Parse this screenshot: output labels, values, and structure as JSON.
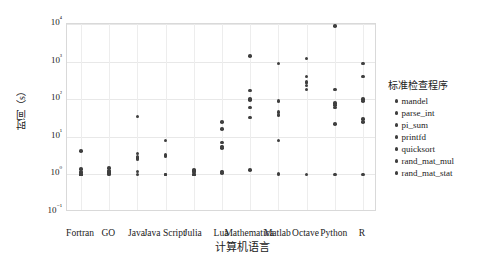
{
  "chart_data": {
    "type": "scatter",
    "title": "",
    "xlabel": "计算机语言",
    "ylabel": "时间（s）",
    "yscale": "log",
    "ylim": [
      0.1,
      10000
    ],
    "grid": true,
    "legend_position": "right",
    "legend_title": "标准检查程序",
    "categories": [
      "Fortran",
      "GO",
      "Java",
      "Java Script",
      "Julia",
      "Lua",
      "Mathematica",
      "Matlab",
      "Octave",
      "Python",
      "R"
    ],
    "ytick_labels": [
      "10⁴",
      "10³",
      "10²",
      "10¹",
      "10⁰",
      "10⁻¹"
    ],
    "ytick_values": [
      10000,
      1000,
      100,
      10,
      1,
      0.1
    ],
    "series": [
      {
        "name": "mandel",
        "values": [
          1.4,
          1.5,
          2.7,
          3.3,
          1.2,
          16.0,
          170.0,
          38.0,
          180.0,
          180.0,
          400.0
        ]
      },
      {
        "name": "parse_int",
        "values": [
          4.2,
          1.1,
          2.9,
          8.0,
          1.3,
          25.0,
          1400.0,
          900.0,
          1200.0,
          9000.0,
          900.0
        ]
      },
      {
        "name": "pi_sum",
        "values": [
          1.0,
          1.05,
          1.0,
          1.0,
          1.0,
          1.1,
          33.0,
          1.05,
          280.0,
          22.0,
          25.0
        ]
      },
      {
        "name": "printfd",
        "values": [
          1.0,
          1.0,
          35.0,
          1.0,
          1.0,
          5.5,
          60.0,
          90.0,
          290.0,
          80.0,
          100.0
        ]
      },
      {
        "name": "quicksort",
        "values": [
          1.15,
          1.2,
          2.5,
          3.2,
          1.2,
          7.0,
          100.0,
          45.0,
          400.0,
          60.0,
          90.0
        ]
      },
      {
        "name": "rand_mat_mul",
        "values": [
          1.0,
          1.1,
          1.2,
          1.0,
          1.0,
          1.2,
          1.3,
          1.0,
          1.0,
          1.0,
          1.0
        ]
      },
      {
        "name": "rand_mat_stat",
        "values": [
          1.0,
          1.25,
          3.6,
          3.0,
          1.25,
          5.0,
          95.0,
          8.0,
          230.0,
          70.0,
          30.0
        ]
      }
    ]
  }
}
